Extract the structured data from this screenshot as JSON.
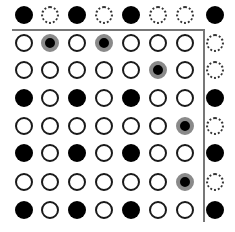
{
  "diagram": {
    "title": "",
    "legend": {
      "F": "filled-black-dot",
      "O": "solid-outline-dot",
      "D": "dashed-outline-dot",
      "G": "gray-ringed-black-dot"
    },
    "colors": {
      "filled": "#000000",
      "outline": "#1a1a1a",
      "ring": "#8a8a8a",
      "line": "#777777",
      "background": "#ffffff"
    },
    "col_x": [
      24,
      50,
      77,
      104,
      131,
      158,
      185,
      215
    ],
    "row_y": [
      15,
      43,
      70,
      98,
      126,
      153,
      182,
      210
    ],
    "grid": [
      [
        "F",
        "D",
        "F",
        "D",
        "F",
        "D",
        "D",
        "F"
      ],
      [
        "O",
        "G",
        "O",
        "G",
        "O",
        "O",
        "O",
        "D"
      ],
      [
        "O",
        "O",
        "O",
        "O",
        "O",
        "G",
        "O",
        "D"
      ],
      [
        "F",
        "O",
        "F",
        "O",
        "F",
        "O",
        "O",
        "F"
      ],
      [
        "O",
        "O",
        "O",
        "O",
        "O",
        "O",
        "G",
        "D"
      ],
      [
        "F",
        "O",
        "F",
        "O",
        "F",
        "O",
        "O",
        "F"
      ],
      [
        "O",
        "O",
        "O",
        "O",
        "O",
        "O",
        "G",
        "D"
      ],
      [
        "F",
        "O",
        "F",
        "O",
        "F",
        "O",
        "O",
        "F"
      ]
    ],
    "separators": {
      "horizontal": {
        "x1": 12,
        "x2": 204,
        "y": 29
      },
      "vertical": {
        "x": 203,
        "y1": 29,
        "y2": 222
      }
    }
  }
}
